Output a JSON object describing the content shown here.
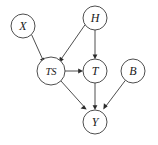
{
  "figure": {
    "type": "directed-acyclic-graph",
    "width": 158,
    "height": 145,
    "background_color": "#ffffff",
    "stroke_color": "#3a3a3a",
    "label_color": "#1a1a1a"
  },
  "nodes": [
    {
      "id": "X",
      "label": "X",
      "cx": 23,
      "cy": 26,
      "r": 12
    },
    {
      "id": "H",
      "label": "H",
      "cx": 95,
      "cy": 18,
      "r": 12
    },
    {
      "id": "TS",
      "label": "TS",
      "cx": 51,
      "cy": 71,
      "r": 14
    },
    {
      "id": "T",
      "label": "T",
      "cx": 95,
      "cy": 71,
      "r": 12
    },
    {
      "id": "B",
      "label": "B",
      "cx": 133,
      "cy": 71,
      "r": 12
    },
    {
      "id": "Y",
      "label": "Y",
      "cx": 95,
      "cy": 122,
      "r": 12
    }
  ],
  "edges": [
    {
      "from": "X",
      "to": "TS"
    },
    {
      "from": "H",
      "to": "TS"
    },
    {
      "from": "H",
      "to": "T"
    },
    {
      "from": "TS",
      "to": "T"
    },
    {
      "from": "TS",
      "to": "Y"
    },
    {
      "from": "T",
      "to": "Y"
    },
    {
      "from": "B",
      "to": "Y"
    }
  ]
}
